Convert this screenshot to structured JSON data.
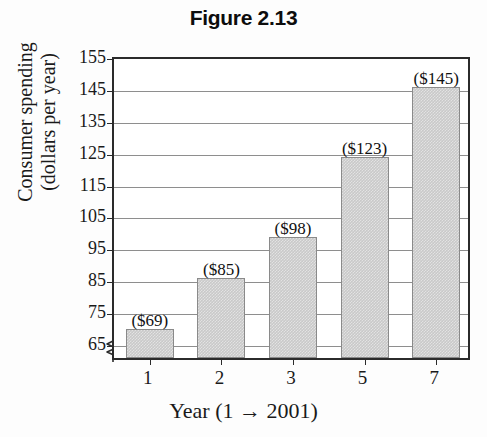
{
  "chart_data": {
    "type": "bar",
    "title": "Figure 2.13",
    "xlabel": "Year (1 → 2001)",
    "ylabel_lines": [
      "Consumer spending",
      "(dollars per year)"
    ],
    "categories": [
      "1",
      "2",
      "3",
      "5",
      "7"
    ],
    "values": [
      69,
      85,
      98,
      123,
      145
    ],
    "data_labels": [
      "($69)",
      "($85)",
      "($98)",
      "($123)",
      "($145)"
    ],
    "ylim": [
      60,
      155
    ],
    "ytick_labels": [
      "155",
      "145",
      "135",
      "125",
      "115",
      "105",
      "95",
      "85",
      "75",
      "65"
    ],
    "ytick_values": [
      155,
      145,
      135,
      125,
      115,
      105,
      95,
      85,
      75,
      65
    ],
    "grid": "horizontal",
    "legend": "none",
    "axis_break": true,
    "colors": {
      "bar_fill": "#c9c9c9",
      "bar_stroke": "#8a8a8a",
      "gridline": "#8e8e8e",
      "axis": "#2b2b2b",
      "background": "#fdfdfd",
      "plot_background": "#ffffff",
      "text": "#1a1a1a"
    }
  }
}
